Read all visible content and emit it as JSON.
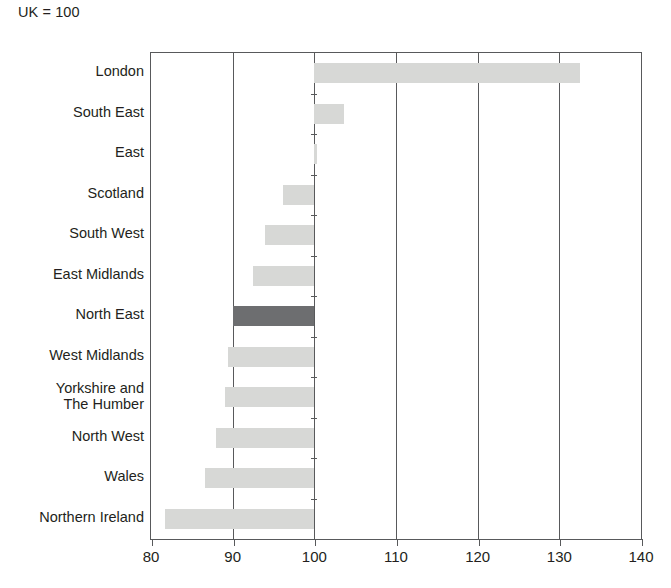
{
  "note": "UK = 100",
  "chart_data": {
    "type": "bar",
    "orientation": "horizontal",
    "title": "",
    "subtitle": "",
    "xlabel": "",
    "ylabel": "",
    "xlim": [
      80,
      140
    ],
    "baseline": 100,
    "grid": true,
    "gridlines": [
      80,
      90,
      100,
      110,
      120,
      130,
      140
    ],
    "xticks": [
      80,
      90,
      100,
      110,
      120,
      130,
      140
    ],
    "xticklabels": [
      "80",
      "90",
      "100",
      "110",
      "120",
      "130",
      "140"
    ],
    "legend": "none",
    "categories": [
      "London",
      "South East",
      "East",
      "Scotland",
      "South West",
      "East Midlands",
      "North East",
      "West Midlands",
      "Yorkshire and\nThe Humber",
      "North West",
      "Wales",
      "Northern Ireland"
    ],
    "values": [
      132.5,
      103.6,
      100.3,
      96.2,
      94.0,
      92.5,
      90.0,
      89.4,
      89.1,
      87.9,
      86.6,
      81.7
    ],
    "highlight_category": "North East",
    "colors": {
      "bar": "#d7d8d6",
      "bar_highlight": "#6d6e70",
      "axis": "#58595b",
      "text": "#231f20",
      "background": "#ffffff"
    }
  }
}
